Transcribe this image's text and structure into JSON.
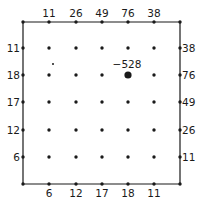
{
  "diagram": {
    "type": "lattice-grid",
    "grid": {
      "columns_x": [
        23,
        49,
        76,
        102,
        128,
        154,
        180
      ],
      "rows_y": [
        22,
        48,
        75,
        102,
        130,
        157,
        184
      ],
      "line_color": "#1a1a1a",
      "dot_color": "#1a1a1a"
    },
    "labels": {
      "top": [
        "11",
        "26",
        "49",
        "76",
        "38"
      ],
      "bottom": [
        "6",
        "12",
        "17",
        "18",
        "11"
      ],
      "left": [
        "11",
        "18",
        "17",
        "12",
        "6"
      ],
      "right": [
        "38",
        "76",
        "49",
        "26",
        "11"
      ]
    },
    "highlight": {
      "label": "−528",
      "col": 4,
      "row": 2
    },
    "stray_dot": {
      "x": 53,
      "y": 64
    }
  }
}
